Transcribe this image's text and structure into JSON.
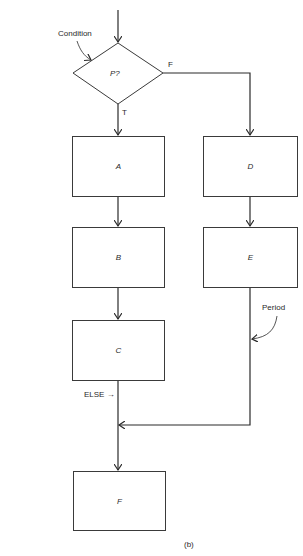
{
  "diagram": {
    "type": "flowchart",
    "caption": "(b)",
    "annotations": {
      "condition": "Condition",
      "period": "Period",
      "else": "ELSE →"
    },
    "decision": {
      "label": "P?",
      "true_branch": "T",
      "false_branch": "F"
    },
    "nodes": [
      {
        "id": "A",
        "label": "A"
      },
      {
        "id": "B",
        "label": "B"
      },
      {
        "id": "C",
        "label": "C"
      },
      {
        "id": "D",
        "label": "D"
      },
      {
        "id": "E",
        "label": "E"
      },
      {
        "id": "F",
        "label": "F"
      }
    ],
    "edges": [
      [
        "start",
        "P?"
      ],
      [
        "P?",
        "A",
        "T"
      ],
      [
        "A",
        "B"
      ],
      [
        "B",
        "C"
      ],
      [
        "C",
        "merge"
      ],
      [
        "P?",
        "D",
        "F"
      ],
      [
        "D",
        "E"
      ],
      [
        "E",
        "merge"
      ],
      [
        "merge",
        "F"
      ]
    ],
    "colors": {
      "line": "#2a2a2a",
      "background": "#ffffff"
    }
  }
}
